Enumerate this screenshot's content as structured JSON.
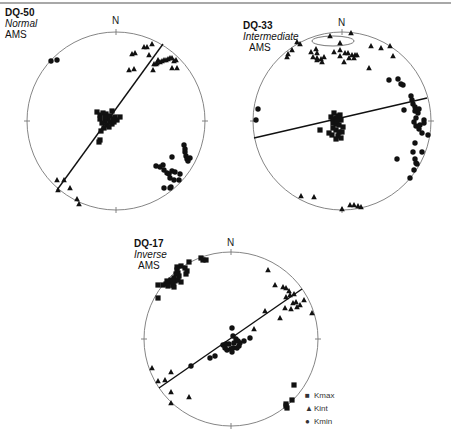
{
  "chart_data": [
    {
      "type": "scatter",
      "projection": "equal-area stereonet (lower hemisphere)",
      "title": "DQ-50",
      "subtitle": "Normal",
      "label": "AMS",
      "north_label": "N",
      "center": [
        116,
        121
      ],
      "radius": 89,
      "plane_line": [
        [
          57,
          190
        ],
        [
          163,
          44
        ]
      ],
      "series": [
        {
          "name": "Kmax",
          "marker": "square",
          "points": [
            [
              97,
              112
            ],
            [
              100,
              115
            ],
            [
              103,
              113
            ],
            [
              106,
              114
            ],
            [
              108,
              118
            ],
            [
              110,
              116
            ],
            [
              112,
              111
            ],
            [
              113,
              119
            ],
            [
              105,
              121
            ],
            [
              100,
              119
            ],
            [
              102,
              123
            ],
            [
              107,
              125
            ],
            [
              110,
              122
            ],
            [
              115,
              117
            ],
            [
              117,
              120
            ],
            [
              112,
              124
            ],
            [
              104,
              128
            ],
            [
              101,
              131
            ],
            [
              100,
              140
            ],
            [
              99,
              142
            ],
            [
              120,
              117
            ],
            [
              105,
              117
            ],
            [
              109,
              127
            ],
            [
              114,
              122
            ]
          ]
        },
        {
          "name": "Kint",
          "marker": "triangle",
          "points": [
            [
              132,
              54
            ],
            [
              135,
              53
            ],
            [
              144,
              47
            ],
            [
              147,
              47
            ],
            [
              152,
              44
            ],
            [
              149,
              55
            ],
            [
              129,
              70
            ],
            [
              134,
              69
            ],
            [
              154,
              64
            ],
            [
              153,
              70
            ],
            [
              157,
              63
            ],
            [
              160,
              62
            ],
            [
              162,
              61
            ],
            [
              164,
              60
            ],
            [
              166,
              60
            ],
            [
              168,
              59
            ],
            [
              170,
              58
            ],
            [
              172,
              58
            ],
            [
              174,
              61
            ],
            [
              176,
              60
            ],
            [
              172,
              68
            ],
            [
              177,
              68
            ],
            [
              158,
              60
            ],
            [
              156,
              64
            ],
            [
              57,
              180
            ],
            [
              64,
              180
            ],
            [
              70,
              188
            ],
            [
              77,
              199
            ],
            [
              79,
              204
            ],
            [
              58,
              190
            ]
          ]
        },
        {
          "name": "Kmin",
          "marker": "circle",
          "points": [
            [
              51,
              61
            ],
            [
              57,
              60
            ],
            [
              184,
              145
            ],
            [
              185,
              149
            ],
            [
              185,
              152
            ],
            [
              186,
              156
            ],
            [
              187,
              159
            ],
            [
              188,
              161
            ],
            [
              190,
              158
            ],
            [
              172,
              157
            ],
            [
              156,
              166
            ],
            [
              160,
              167
            ],
            [
              163,
              165
            ],
            [
              164,
              170
            ],
            [
              167,
              173
            ],
            [
              169,
              174
            ],
            [
              172,
              171
            ],
            [
              175,
              172
            ],
            [
              170,
              178
            ],
            [
              174,
              180
            ],
            [
              179,
              180
            ],
            [
              171,
              187
            ],
            [
              164,
              188
            ],
            [
              170,
              188
            ],
            [
              180,
              174
            ]
          ]
        }
      ]
    },
    {
      "type": "scatter",
      "projection": "equal-area stereonet (lower hemisphere)",
      "title": "DQ-33",
      "subtitle": "Intermediate",
      "label": "AMS",
      "north_label": "N",
      "center": [
        342,
        121
      ],
      "radius": 89,
      "plane_line": [
        [
          254,
          138
        ],
        [
          427,
          98
        ]
      ],
      "series": [
        {
          "name": "Kmax",
          "marker": "square",
          "points": [
            [
              331,
              117
            ],
            [
              333,
              119
            ],
            [
              336,
              118
            ],
            [
              338,
              116
            ],
            [
              340,
              115
            ],
            [
              341,
              120
            ],
            [
              333,
              123
            ],
            [
              336,
              124
            ],
            [
              339,
              125
            ],
            [
              333,
              128
            ],
            [
              336,
              130
            ],
            [
              339,
              132
            ],
            [
              342,
              132
            ],
            [
              338,
              136
            ],
            [
              336,
              139
            ],
            [
              341,
              138
            ],
            [
              320,
              130
            ],
            [
              329,
              133
            ],
            [
              332,
              135
            ],
            [
              343,
              127
            ],
            [
              334,
              113
            ],
            [
              337,
              121
            ]
          ]
        },
        {
          "name": "Kint",
          "marker": "triangle",
          "points": [
            [
              330,
              36
            ],
            [
              351,
              33
            ],
            [
              297,
              42
            ],
            [
              300,
              44
            ],
            [
              292,
              50
            ],
            [
              288,
              54
            ],
            [
              287,
              57
            ],
            [
              316,
              49
            ],
            [
              317,
              53
            ],
            [
              317,
              58
            ],
            [
              340,
              43
            ],
            [
              340,
              50
            ],
            [
              334,
              52
            ],
            [
              340,
              56
            ],
            [
              345,
              53
            ],
            [
              348,
              53
            ],
            [
              349,
              58
            ],
            [
              352,
              55
            ],
            [
              355,
              55
            ],
            [
              357,
              55
            ],
            [
              354,
              58
            ],
            [
              311,
              52
            ],
            [
              313,
              57
            ],
            [
              317,
              60
            ],
            [
              321,
              59
            ],
            [
              324,
              57
            ],
            [
              322,
              62
            ],
            [
              344,
              62
            ],
            [
              371,
              46
            ],
            [
              381,
              48
            ],
            [
              390,
              46
            ],
            [
              393,
              56
            ],
            [
              369,
              68
            ],
            [
              301,
              196
            ],
            [
              314,
              197
            ],
            [
              342,
              209
            ],
            [
              350,
              205
            ],
            [
              354,
              205
            ],
            [
              358,
              206
            ],
            [
              361,
              207
            ]
          ]
        },
        {
          "name": "Kmin",
          "marker": "circle",
          "points": [
            [
              258,
              109
            ],
            [
              256,
              120
            ],
            [
              389,
              80
            ],
            [
              398,
              79
            ],
            [
              401,
              84
            ],
            [
              403,
              85
            ],
            [
              411,
              96
            ],
            [
              412,
              100
            ],
            [
              413,
              104
            ],
            [
              415,
              107
            ],
            [
              415,
              111
            ],
            [
              418,
              113
            ],
            [
              419,
              109
            ],
            [
              404,
              110
            ],
            [
              416,
              118
            ],
            [
              414,
              122
            ],
            [
              416,
              126
            ],
            [
              419,
              129
            ],
            [
              420,
              125
            ],
            [
              424,
              120
            ],
            [
              422,
              133
            ],
            [
              428,
              135
            ],
            [
              424,
              123
            ],
            [
              415,
              143
            ],
            [
              413,
              152
            ],
            [
              422,
              152
            ],
            [
              397,
              159
            ],
            [
              415,
              159
            ],
            [
              416,
              163
            ],
            [
              417,
              164
            ],
            [
              414,
              170
            ],
            [
              410,
              178
            ]
          ]
        }
      ],
      "annotations": [
        {
          "type": "confidence-ellipse",
          "cx": 333,
          "cy": 41,
          "rx": 21,
          "ry": 5
        }
      ]
    },
    {
      "type": "scatter",
      "projection": "equal-area stereonet (lower hemisphere)",
      "title": "DQ-17",
      "subtitle": "Inverse",
      "label": "AMS",
      "north_label": "N",
      "center": [
        231,
        339
      ],
      "radius": 87,
      "plane_line": [
        [
          159,
          388
        ],
        [
          302,
          289
        ]
      ],
      "series": [
        {
          "name": "Kmax",
          "marker": "square",
          "points": [
            [
              201,
              258
            ],
            [
              203,
              260
            ],
            [
              206,
              260
            ],
            [
              189,
              262
            ],
            [
              185,
              268
            ],
            [
              187,
              271
            ],
            [
              186,
              274
            ],
            [
              178,
              273
            ],
            [
              179,
              276
            ],
            [
              176,
              274
            ],
            [
              174,
              278
            ],
            [
              171,
              280
            ],
            [
              170,
              282
            ],
            [
              166,
              284
            ],
            [
              168,
              286
            ],
            [
              167,
              281
            ],
            [
              175,
              281
            ],
            [
              178,
              280
            ],
            [
              177,
              270
            ],
            [
              181,
              266
            ],
            [
              177,
              267
            ],
            [
              163,
              285
            ],
            [
              158,
              285
            ],
            [
              173,
              285
            ],
            [
              158,
              298
            ],
            [
              181,
              282
            ],
            [
              173,
              285
            ],
            [
              174,
              287
            ],
            [
              294,
              385
            ],
            [
              292,
              400
            ],
            [
              286,
              404
            ],
            [
              287,
              408
            ],
            [
              286,
              406
            ]
          ]
        },
        {
          "name": "Kint",
          "marker": "triangle",
          "points": [
            [
              268,
              270
            ],
            [
              275,
              285
            ],
            [
              283,
              287
            ],
            [
              286,
              288
            ],
            [
              289,
              291
            ],
            [
              294,
              294
            ],
            [
              290,
              295
            ],
            [
              286,
              297
            ],
            [
              293,
              303
            ],
            [
              296,
              302
            ],
            [
              300,
              305
            ],
            [
              304,
              300
            ],
            [
              297,
              307
            ],
            [
              291,
              309
            ],
            [
              285,
              308
            ],
            [
              312,
              313
            ],
            [
              265,
              311
            ],
            [
              280,
              318
            ],
            [
              254,
              329
            ],
            [
              152,
              368
            ],
            [
              171,
              372
            ],
            [
              165,
              380
            ],
            [
              158,
              381
            ],
            [
              171,
              392
            ],
            [
              189,
              397
            ],
            [
              171,
              403
            ]
          ]
        },
        {
          "name": "Kmin",
          "marker": "circle",
          "points": [
            [
              232,
              328
            ],
            [
              233,
              336
            ],
            [
              236,
              339
            ],
            [
              234,
              343
            ],
            [
              229,
              344
            ],
            [
              226,
              344
            ],
            [
              223,
              345
            ],
            [
              225,
              348
            ],
            [
              227,
              350
            ],
            [
              231,
              349
            ],
            [
              233,
              348
            ],
            [
              232,
              352
            ],
            [
              237,
              348
            ],
            [
              239,
              346
            ],
            [
              240,
              343
            ],
            [
              238,
              341
            ],
            [
              244,
              341
            ],
            [
              250,
              338
            ],
            [
              225,
              345
            ],
            [
              210,
              358
            ],
            [
              215,
              356
            ],
            [
              191,
              366
            ]
          ]
        }
      ]
    }
  ],
  "legend": {
    "items": [
      {
        "label": "Kmax",
        "symbol": "■"
      },
      {
        "label": "Kint",
        "symbol": "▲"
      },
      {
        "label": "Kmin",
        "symbol": "●"
      }
    ]
  },
  "colors": {
    "ink": "#111111",
    "circle": "#777777",
    "topline": "#a8a8a8"
  }
}
